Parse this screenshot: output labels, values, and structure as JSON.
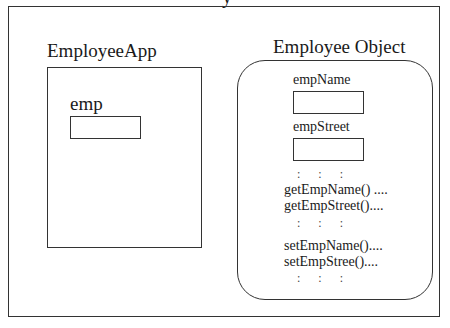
{
  "diagram": {
    "top_cut_glyph": "y",
    "app": {
      "title": "EmployeeApp",
      "variable_label": "emp"
    },
    "object": {
      "title": "Employee Object",
      "fields": [
        {
          "label": "empName"
        },
        {
          "label": "empStreet"
        }
      ],
      "ellipsis_row": ":      :      :",
      "getters": [
        "getEmpName() ....",
        "getEmpStreet()...."
      ],
      "setters": [
        "setEmpName()....",
        "setEmpStree()...."
      ]
    }
  }
}
